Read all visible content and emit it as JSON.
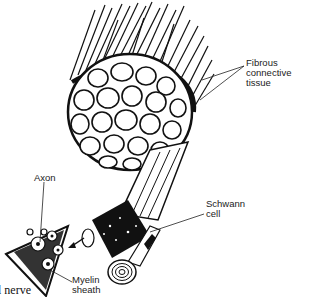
{
  "diagram": {
    "type": "anatomical-illustration",
    "labels": {
      "fibrous": [
        "Fibrous connective",
        "tissue"
      ],
      "schwann": [
        "Schwann",
        "cell"
      ],
      "axon": "Axon",
      "myelin": [
        "Myelin",
        "sheath"
      ],
      "nerve": "l nerve"
    },
    "colors": {
      "ink": "#111111",
      "paper": "#ffffff",
      "label_text": "#222222"
    }
  }
}
